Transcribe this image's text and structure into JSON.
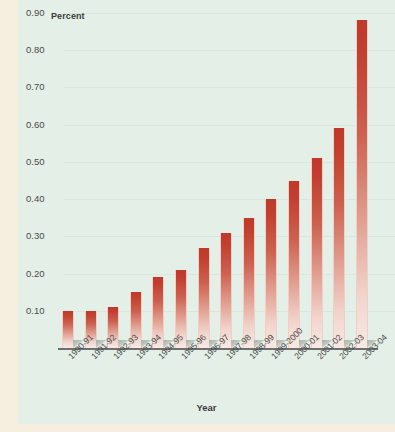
{
  "chart_data": {
    "type": "bar",
    "title": "",
    "ylabel": "Percent",
    "xlabel": "Year",
    "ylim": [
      0.0,
      0.9
    ],
    "grid": true,
    "legend": null,
    "categories": [
      "1990-91",
      "1991-92",
      "1992-93",
      "1993-94",
      "1994-95",
      "1995-96",
      "1996-97",
      "1997-98",
      "1998-99",
      "1999-2000",
      "2000-01",
      "2001-02",
      "2002-03",
      "2003-04"
    ],
    "values": [
      0.1,
      0.1,
      0.11,
      0.15,
      0.19,
      0.21,
      0.27,
      0.31,
      0.35,
      0.4,
      0.45,
      0.51,
      0.59,
      0.88
    ],
    "ytick_labels": [
      "0.90",
      "0.80",
      "0.70",
      "0.60",
      "0.50",
      "0.40",
      "0.30",
      "0.20",
      "0.10"
    ],
    "ytick_values": [
      0.9,
      0.8,
      0.7,
      0.6,
      0.5,
      0.4,
      0.3,
      0.2,
      0.1
    ],
    "bar_color_top": "#c0392b",
    "bar_color_bottom": "#f8e9e4",
    "panel_color": "#e4f0e7",
    "page_color": "#f6efdf",
    "axis_color": "#6f6f6f",
    "text_color": "#3b3b3b"
  }
}
